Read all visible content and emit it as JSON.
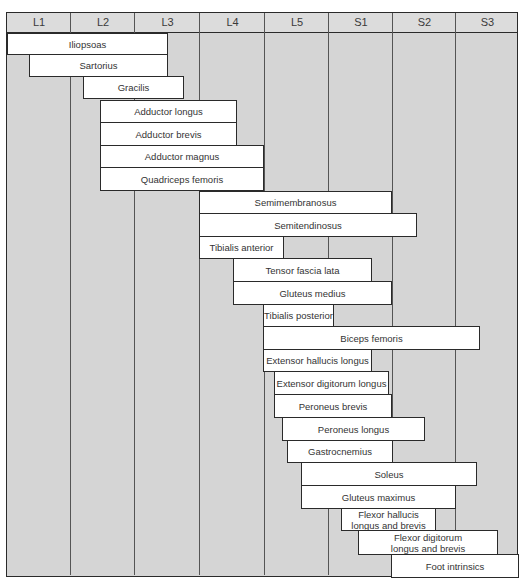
{
  "grid": {
    "columns": [
      "L1",
      "L2",
      "L3",
      "L4",
      "L5",
      "S1",
      "S2",
      "S3"
    ],
    "column_edges": [
      0,
      64,
      128,
      193,
      258,
      322,
      386,
      449,
      512
    ]
  },
  "colors": {
    "background": "#d5d5d5",
    "header": "#dcdcdc",
    "bar_fill": "#ffffff",
    "border": "#2a2a2a"
  },
  "muscles": [
    {
      "label": "Iliopsoas",
      "x1": 1,
      "x2": 161,
      "y1": 21,
      "y2": 42
    },
    {
      "label": "Sartorius",
      "x1": 23,
      "x2": 161,
      "y1": 42,
      "y2": 64
    },
    {
      "label": "Gracilis",
      "x1": 77,
      "x2": 177,
      "y1": 64,
      "y2": 86
    },
    {
      "label": "Adductor longus",
      "x1": 94,
      "x2": 230,
      "y1": 88,
      "y2": 110
    },
    {
      "label": "Adductor brevis",
      "x1": 94,
      "x2": 230,
      "y1": 110,
      "y2": 133
    },
    {
      "label": "Adductor magnus",
      "x1": 94,
      "x2": 257,
      "y1": 133,
      "y2": 155
    },
    {
      "label": "Quadriceps femoris",
      "x1": 94,
      "x2": 257,
      "y1": 155,
      "y2": 178
    },
    {
      "label": "Semimembranosus",
      "x1": 193,
      "x2": 385,
      "y1": 179,
      "y2": 201
    },
    {
      "label": "Semitendinosus",
      "x1": 193,
      "x2": 410,
      "y1": 201,
      "y2": 224
    },
    {
      "label": "Tibialis anterior",
      "x1": 193,
      "x2": 277,
      "y1": 224,
      "y2": 246
    },
    {
      "label": "Tensor fascia lata",
      "x1": 227,
      "x2": 365,
      "y1": 246,
      "y2": 269
    },
    {
      "label": "Gluteus medius",
      "x1": 227,
      "x2": 385,
      "y1": 269,
      "y2": 292
    },
    {
      "label": "Tibialis posterior",
      "x1": 257,
      "x2": 327,
      "y1": 292,
      "y2": 314
    },
    {
      "label": "Biceps femoris",
      "x1": 257,
      "x2": 473,
      "y1": 314,
      "y2": 337
    },
    {
      "label": "Extensor hallucis longus",
      "x1": 257,
      "x2": 365,
      "y1": 337,
      "y2": 359
    },
    {
      "label": "Extensor digitorum longus",
      "x1": 268,
      "x2": 382,
      "y1": 359,
      "y2": 382
    },
    {
      "label": "Peroneus brevis",
      "x1": 268,
      "x2": 385,
      "y1": 382,
      "y2": 405
    },
    {
      "label": "Peroneus longus",
      "x1": 276,
      "x2": 418,
      "y1": 405,
      "y2": 428
    },
    {
      "label": "Gastrocnemius",
      "x1": 281,
      "x2": 386,
      "y1": 428,
      "y2": 450
    },
    {
      "label": "Soleus",
      "x1": 295,
      "x2": 470,
      "y1": 450,
      "y2": 473
    },
    {
      "label": "Gluteus maximus",
      "x1": 295,
      "x2": 449,
      "y1": 473,
      "y2": 496
    },
    {
      "label": "Flexor hallucis\nlongus and brevis",
      "x1": 335,
      "x2": 429,
      "y1": 496,
      "y2": 518
    },
    {
      "label": "Flexor digitorum\nlongus and brevis",
      "x1": 352,
      "x2": 491,
      "y1": 518,
      "y2": 542
    },
    {
      "label": "Foot intrinsics",
      "x1": 385,
      "x2": 512,
      "y1": 542,
      "y2": 565
    }
  ]
}
